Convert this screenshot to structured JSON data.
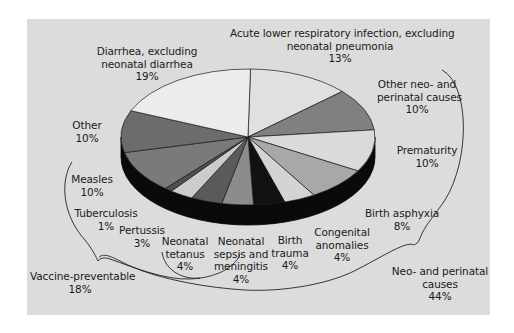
{
  "chart_data": {
    "type": "pie",
    "style": "3d-exploded-none",
    "title": "",
    "unit": "%",
    "slices": [
      {
        "label": "Acute lower respiratory infection, excluding neonatal pneumonia",
        "value": 13,
        "color": "#e0e0e0"
      },
      {
        "label": "Other neo- and perinatal causes",
        "value": 10,
        "color": "#808080"
      },
      {
        "label": "Prematurity",
        "value": 10,
        "color": "#dadada"
      },
      {
        "label": "Birth asphyxia",
        "value": 8,
        "color": "#a8a8a8"
      },
      {
        "label": "Congenital anomalies",
        "value": 4,
        "color": "#d4d4d4"
      },
      {
        "label": "Birth trauma",
        "value": 4,
        "color": "#111111"
      },
      {
        "label": "Neonatal sepsis and meningitis",
        "value": 4,
        "color": "#8c8c8c"
      },
      {
        "label": "Neonatal tetanus",
        "value": 4,
        "color": "#5a5a5a"
      },
      {
        "label": "Pertussis",
        "value": 3,
        "color": "#cccccc"
      },
      {
        "label": "Tuberculosis",
        "value": 1,
        "color": "#505050"
      },
      {
        "label": "Measles",
        "value": 10,
        "color": "#7a7a7a"
      },
      {
        "label": "Other",
        "value": 10,
        "color": "#6c6c6c"
      },
      {
        "label": "Diarrhea, excluding neonatal diarrhea",
        "value": 19,
        "color": "#ececec"
      }
    ],
    "groups": [
      {
        "label": "Vaccine-preventable",
        "value": 18,
        "members": [
          "Measles",
          "Tuberculosis",
          "Pertussis",
          "Neonatal tetanus"
        ]
      },
      {
        "label": "Neo- and perinatal causes",
        "value": 44,
        "members": [
          "Other neo- and perinatal causes",
          "Prematurity",
          "Birth asphyxia",
          "Congenital anomalies",
          "Birth trauma",
          "Neonatal sepsis and meningitis",
          "Neonatal tetanus"
        ]
      }
    ],
    "legend": "none (direct labels)"
  },
  "labels": {
    "ari": {
      "l1": "Acute lower respiratory infection, excluding",
      "l2": "neonatal pneumonia",
      "pct": "13%"
    },
    "other_neo": {
      "l1": "Other neo- and",
      "l2": "perinatal causes",
      "pct": "10%"
    },
    "prematurity": {
      "l1": "Prematurity",
      "pct": "10%"
    },
    "birth_asphyxia": {
      "l1": "Birth asphyxia",
      "pct": "8%"
    },
    "congenital": {
      "l1": "Congenital",
      "l2": "anomalies",
      "pct": "4%"
    },
    "birth_trauma": {
      "l1": "Birth",
      "l2": "trauma",
      "pct": "4%"
    },
    "sepsis": {
      "l1": "Neonatal",
      "l2": "sepsis and",
      "l3": "meningitis",
      "pct": "4%"
    },
    "tetanus": {
      "l1": "Neonatal",
      "l2": "tetanus",
      "pct": "4%"
    },
    "pertussis": {
      "l1": "Pertussis",
      "pct": "3%"
    },
    "tuberculosis": {
      "l1": "Tuberculosis",
      "pct": "1%"
    },
    "measles": {
      "l1": "Measles",
      "pct": "10%"
    },
    "other": {
      "l1": "Other",
      "pct": "10%"
    },
    "diarrhea": {
      "l1": "Diarrhea, excluding",
      "l2": "neonatal diarrhea",
      "pct": "19%"
    },
    "vaccine": {
      "l1": "Vaccine-preventable",
      "pct": "18%"
    },
    "neo_group": {
      "l1": "Neo- and perinatal",
      "l2": "causes",
      "pct": "44%"
    }
  }
}
